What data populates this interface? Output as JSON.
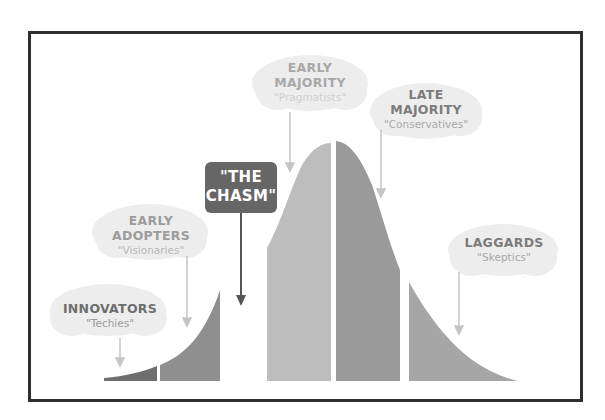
{
  "diagram": {
    "chasm": {
      "line1": "\"THE",
      "line2": "CHASM\""
    },
    "segments": [
      {
        "id": "innovators",
        "label": "INNOVATORS",
        "sublabel": "\"Techies\"",
        "color": "#6e6e6e",
        "label_color": "#6e6e6e",
        "sub_color": "#9a9a9a"
      },
      {
        "id": "early-adopters",
        "label": "EARLY",
        "label2": "ADOPTERS",
        "sublabel": "\"Visionaries\"",
        "color": "#8f8f8f",
        "label_color": "#9c9c9c",
        "sub_color": "#b8b8b8"
      },
      {
        "id": "early-majority",
        "label": "EARLY",
        "label2": "MAJORITY",
        "sublabel": "\"Pragmatists\"",
        "color": "#bdbdbd",
        "label_color": "#a8a8a8",
        "sub_color": "#cfcfcf"
      },
      {
        "id": "late-majority",
        "label": "LATE",
        "label2": "MAJORITY",
        "sublabel": "\"Conservatives\"",
        "color": "#9a9a9a",
        "label_color": "#7c7c7c",
        "sub_color": "#a9a9a9"
      },
      {
        "id": "laggards",
        "label": "LAGGARDS",
        "sublabel": "\"Skeptics\"",
        "color": "#a6a6a6",
        "label_color": "#7c7c7c",
        "sub_color": "#a9a9a9"
      }
    ],
    "colors": {
      "frame": "#2f2f2f",
      "chasm_box": "#666666",
      "cloud": "#ededed",
      "arrow": "#bdbdbd",
      "chasm_arrow": "#555555"
    }
  }
}
